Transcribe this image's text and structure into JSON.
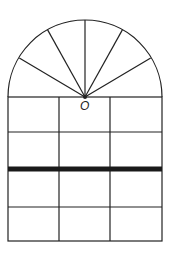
{
  "diagram": {
    "center_label": "O",
    "colors": {
      "stroke": "#222222",
      "bar": "#1a1a1a",
      "background": "#ffffff"
    },
    "arch": {
      "center_x": 85,
      "center_y": 97,
      "radius": 77,
      "radial_spokes": 7
    },
    "grid": {
      "columns": 3,
      "rows": 4,
      "thick_bar_row_index": 2
    }
  }
}
